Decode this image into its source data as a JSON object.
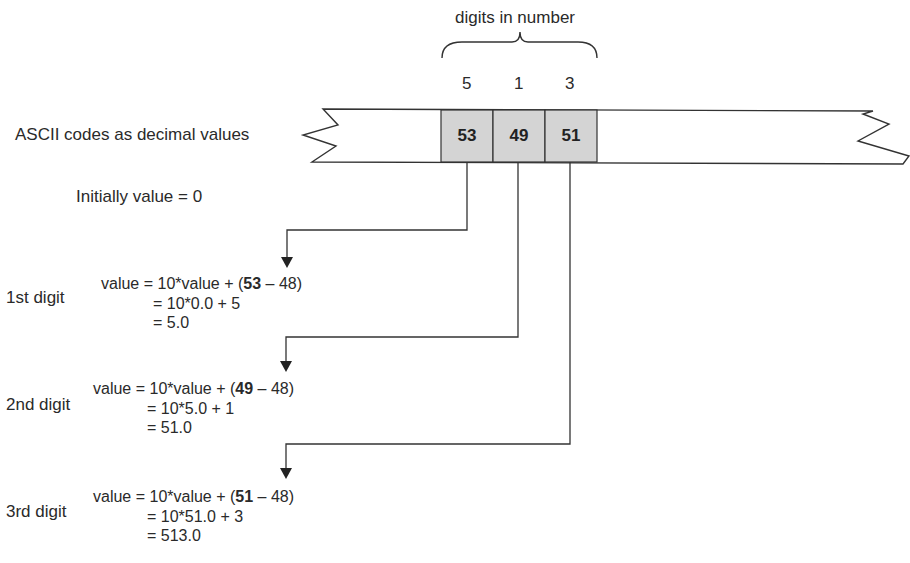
{
  "title": "digits in number",
  "digits": [
    "5",
    "1",
    "3"
  ],
  "tape_label": "ASCII codes as decimal values",
  "ascii_codes": [
    "53",
    "49",
    "51"
  ],
  "initial": "Initially value = 0",
  "colors": {
    "cell_fill": "#d4d4d4",
    "line": "#333333",
    "text": "#2a2a2a"
  },
  "steps": [
    {
      "label": "1st digit",
      "line1_pre": "value = 10*value + (",
      "line1_bold": "53",
      "line1_post": " – 48)",
      "line2": "= 10*0.0 + 5",
      "line3": "= 5.0"
    },
    {
      "label": "2nd digit",
      "line1_pre": "value = 10*value + (",
      "line1_bold": "49",
      "line1_post": " – 48)",
      "line2": "= 10*5.0 + 1",
      "line3": "= 51.0"
    },
    {
      "label": "3rd digit",
      "line1_pre": "value = 10*value + (",
      "line1_bold": "51",
      "line1_post": " – 48)",
      "line2": "= 10*51.0 + 3",
      "line3": "= 513.0"
    }
  ]
}
